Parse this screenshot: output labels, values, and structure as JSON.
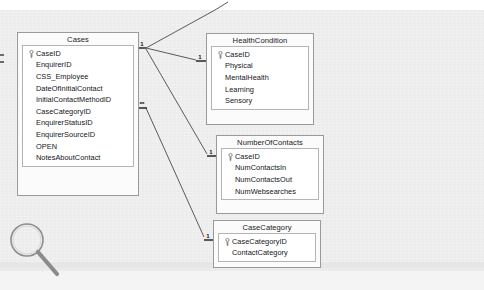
{
  "diagram": {
    "kind": "database-relationships",
    "background_color": "#ececec",
    "line_color": "#5a5a5a",
    "tables": [
      {
        "id": "cases",
        "title": "Cases",
        "fields": [
          {
            "name": "CaseID",
            "primary_key": true
          },
          {
            "name": "EnquirerID",
            "primary_key": false
          },
          {
            "name": "CSS_Employee",
            "primary_key": false
          },
          {
            "name": "DateOfInitialContact",
            "primary_key": false
          },
          {
            "name": "InitialContactMethodID",
            "primary_key": false
          },
          {
            "name": "CaseCategoryID",
            "primary_key": false
          },
          {
            "name": "EnquirerStatusID",
            "primary_key": false
          },
          {
            "name": "EnquirerSourceID",
            "primary_key": false
          },
          {
            "name": "OPEN",
            "primary_key": false
          },
          {
            "name": "NotesAboutContact",
            "primary_key": false
          }
        ]
      },
      {
        "id": "healthcondition",
        "title": "HealthCondition",
        "fields": [
          {
            "name": "CaseID",
            "primary_key": true
          },
          {
            "name": "Physical",
            "primary_key": false
          },
          {
            "name": "MentalHealth",
            "primary_key": false
          },
          {
            "name": "Learning",
            "primary_key": false
          },
          {
            "name": "Sensory",
            "primary_key": false
          }
        ]
      },
      {
        "id": "numberofcontacts",
        "title": "NumberOfContacts",
        "fields": [
          {
            "name": "CaseID",
            "primary_key": true
          },
          {
            "name": "NumContactsIn",
            "primary_key": false
          },
          {
            "name": "NumContactsOut",
            "primary_key": false
          },
          {
            "name": "NumWebsearches",
            "primary_key": false
          }
        ]
      },
      {
        "id": "casecategory",
        "title": "CaseCategory",
        "fields": [
          {
            "name": "CaseCategoryID",
            "primary_key": true
          },
          {
            "name": "ContactCategory",
            "primary_key": false
          }
        ]
      }
    ],
    "cardinality_markers": [
      {
        "id": "cases-one",
        "label": "1",
        "side": "cases"
      },
      {
        "id": "cases-many",
        "label": "∞",
        "side": "cases"
      },
      {
        "id": "healthcondition-one",
        "label": "1",
        "side": "healthcondition"
      },
      {
        "id": "numberofcontacts-one",
        "label": "1",
        "side": "numberofcontacts"
      },
      {
        "id": "casecategory-one",
        "label": "1",
        "side": "casecategory"
      }
    ],
    "relationships": [
      {
        "from": "Cases",
        "from_card": "1",
        "to": "HealthCondition",
        "to_card": "1"
      },
      {
        "from": "Cases",
        "from_card": "1",
        "to": "NumberOfContacts",
        "to_card": "1"
      },
      {
        "from": "Cases",
        "from_card": "1",
        "to": "offscreen-top",
        "to_card": ""
      },
      {
        "from": "Cases",
        "from_card": "∞",
        "to": "CaseCategory",
        "to_card": "1"
      }
    ],
    "cursor": {
      "icon": "magnifier-icon"
    }
  }
}
